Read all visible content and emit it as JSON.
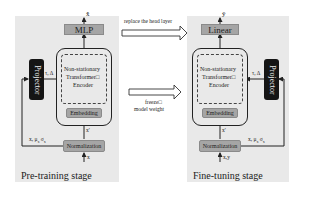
{
  "left_panel": {
    "stage_label": "Pre-training stage",
    "head_label": "MLP",
    "output_label": "x̂",
    "encoder_label_lines": [
      "Non-stationary",
      "Transformer□",
      "Encoder"
    ],
    "embedding_label": "Embedding",
    "normalization_label": "Normalization",
    "input_label": "x",
    "normalized_label": "x'",
    "stats_label": "x, μ",
    "stats_sub": "x",
    "stats_sigma": "σ",
    "stats_sigma_sub": "x",
    "projector_label": "Projector",
    "projector_out_label": "τ, Δ"
  },
  "right_panel": {
    "stage_label": "Fine-tuning stage",
    "head_label": "Linear",
    "output_label": "ŷ",
    "encoder_label_lines": [
      "Non-stationary",
      "Transformer□",
      "Encoder"
    ],
    "embedding_label": "Embedding",
    "normalization_label": "Normalization",
    "input_label": "x,y",
    "normalized_label": "x'",
    "stats_label": "x, μ",
    "stats_sub": "x",
    "stats_sigma": "σ",
    "stats_sigma_sub": "x",
    "projector_label": "Projector",
    "projector_out_label": "τ, Δ"
  },
  "transitions": {
    "top_label": "replace the head layer",
    "bottom_label_lines": [
      "freeze□",
      "model weight"
    ]
  },
  "colors": {
    "panel_bg": "#e9e9e9",
    "head_fill": "#a5a5a5",
    "projector_fill": "#151515"
  }
}
